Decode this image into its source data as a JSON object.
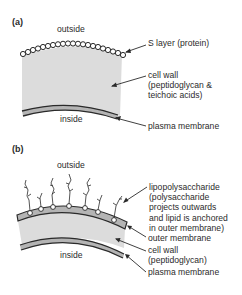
{
  "panels": [
    {
      "id": "a",
      "label": "(a)",
      "outside": "outside",
      "inside": "inside",
      "annotations": [
        {
          "text": "S layer (protein)"
        },
        {
          "text": "cell wall\n(peptidoglycan &\nteichoic acids)"
        },
        {
          "text": "plasma membrane"
        }
      ]
    },
    {
      "id": "b",
      "label": "(b)",
      "outside": "outside",
      "inside": "inside",
      "annotations": [
        {
          "text": "lipopolysaccharide\n(polysaccharide\nprojects outwards\nand lipid is anchored\nin outer membrane)"
        },
        {
          "text": "outer membrane"
        },
        {
          "text": "cell wall\n(peptidoglycan)"
        },
        {
          "text": "plasma membrane"
        }
      ]
    }
  ],
  "colors": {
    "cell_wall_fill": "#dcdcdc",
    "membrane_fill": "#b4b4b4",
    "line": "#2a2a2a",
    "background": "#ffffff"
  }
}
